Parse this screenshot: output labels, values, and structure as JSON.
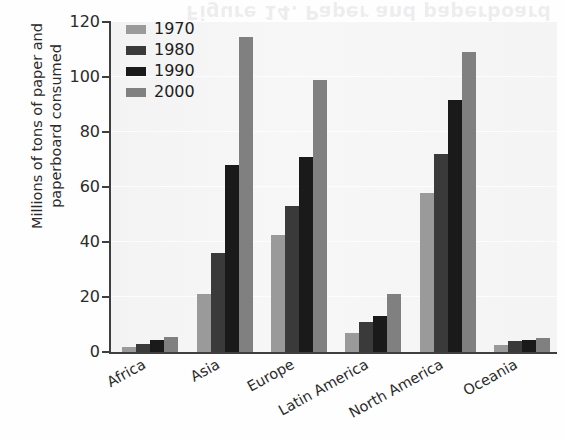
{
  "page": {
    "ghost_text": "Figure 14. Paper and paperboard"
  },
  "chart_data": {
    "type": "bar",
    "title": "",
    "xlabel": "",
    "ylabel": "Millions of tons of paper and paperboard consumed",
    "ylabel_lines": [
      "Millions of tons of paper and",
      "paperboard consumed"
    ],
    "categories": [
      "Africa",
      "Asia",
      "Europe",
      "Latin America",
      "North America",
      "Oceania"
    ],
    "series": [
      {
        "name": "1970",
        "color": "#9a9a9a",
        "values": [
          2,
          21,
          42.5,
          7,
          58,
          2.5
        ]
      },
      {
        "name": "1980",
        "color": "#3a3a3a",
        "values": [
          3,
          36,
          53,
          11,
          72,
          4
        ]
      },
      {
        "name": "1990",
        "color": "#1a1a1a",
        "values": [
          4.5,
          68,
          71,
          13,
          91.5,
          4.5
        ]
      },
      {
        "name": "2000",
        "color": "#808080",
        "values": [
          5.5,
          114.5,
          99,
          21,
          109,
          5
        ]
      }
    ],
    "ylim": [
      0,
      120
    ],
    "yticks": [
      0,
      20,
      40,
      60,
      80,
      100,
      120
    ],
    "ytick_labels": [
      "0",
      "20",
      "40",
      "60",
      "80",
      "100",
      "120"
    ],
    "grid": true,
    "legend_position": "top-left",
    "legend_entries": [
      "1970",
      "1980",
      "1990",
      "2000"
    ]
  }
}
